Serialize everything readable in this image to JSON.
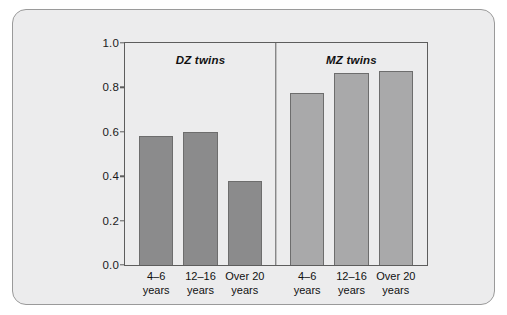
{
  "chart_data": {
    "type": "bar",
    "title": "",
    "xlabel": "",
    "ylabel": "",
    "ylim": [
      0.0,
      1.0
    ],
    "grid": false,
    "legend": "none",
    "yticks": [
      "0.0",
      "0.2",
      "0.4",
      "0.6",
      "0.8",
      "1.0"
    ],
    "ytick_values": [
      0.0,
      0.2,
      0.4,
      0.6,
      0.8,
      1.0
    ],
    "categories": [
      "4–6 years",
      "12–16 years",
      "Over 20 years"
    ],
    "panels": [
      {
        "title": "DZ twins",
        "bar_color": "#8b8b8c",
        "values": [
          0.58,
          0.6,
          0.38
        ],
        "bars": [
          {
            "label_line1": "4–6",
            "label_line2": "years",
            "value": 0.58
          },
          {
            "label_line1": "12–16",
            "label_line2": "years",
            "value": 0.6
          },
          {
            "label_line1": "Over 20",
            "label_line2": "years",
            "value": 0.38
          }
        ]
      },
      {
        "title": "MZ twins",
        "bar_color": "#a9a9aa",
        "values": [
          0.775,
          0.865,
          0.875
        ],
        "bars": [
          {
            "label_line1": "4–6",
            "label_line2": "years",
            "value": 0.775
          },
          {
            "label_line1": "12–16",
            "label_line2": "years",
            "value": 0.865
          },
          {
            "label_line1": "Over 20",
            "label_line2": "years",
            "value": 0.875
          }
        ]
      }
    ]
  },
  "colors": {
    "card_background": "#ececed",
    "card_border": "#9a9a9a",
    "axis": "#5d5d5d",
    "dz_bar": "#8b8b8c",
    "mz_bar": "#a9a9aa",
    "text": "#111111"
  }
}
